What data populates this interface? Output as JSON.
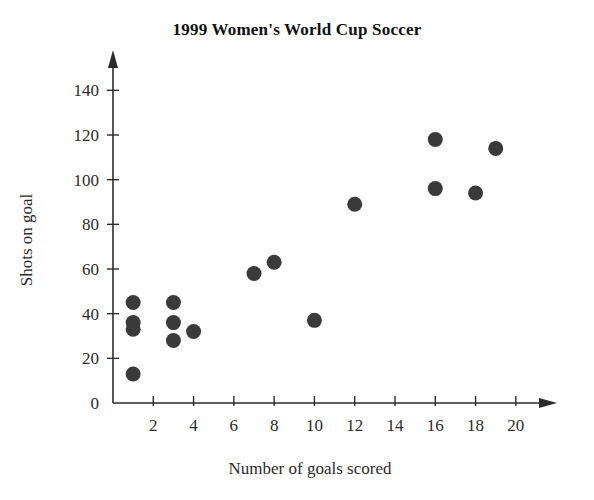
{
  "chart_data": {
    "type": "scatter",
    "title": "1999 Women's World Cup Soccer",
    "xlabel": "Number of goals scored",
    "ylabel": "Shots on goal",
    "xlim": [
      0,
      21
    ],
    "ylim": [
      0,
      150
    ],
    "xticks": [
      2,
      4,
      6,
      8,
      10,
      12,
      14,
      16,
      18,
      20
    ],
    "yticks": [
      0,
      20,
      40,
      60,
      80,
      100,
      120,
      140
    ],
    "grid": false,
    "legend": null,
    "marker_color": "#3a3a3a",
    "axis_color": "#2b2b2b",
    "points": [
      {
        "x": 1,
        "y": 45
      },
      {
        "x": 1,
        "y": 36
      },
      {
        "x": 1,
        "y": 33
      },
      {
        "x": 1,
        "y": 13
      },
      {
        "x": 3,
        "y": 45
      },
      {
        "x": 3,
        "y": 36
      },
      {
        "x": 3,
        "y": 28
      },
      {
        "x": 4,
        "y": 32
      },
      {
        "x": 7,
        "y": 58
      },
      {
        "x": 8,
        "y": 63
      },
      {
        "x": 10,
        "y": 37
      },
      {
        "x": 12,
        "y": 89
      },
      {
        "x": 16,
        "y": 118
      },
      {
        "x": 16,
        "y": 96
      },
      {
        "x": 18,
        "y": 94
      },
      {
        "x": 19,
        "y": 114
      }
    ]
  }
}
